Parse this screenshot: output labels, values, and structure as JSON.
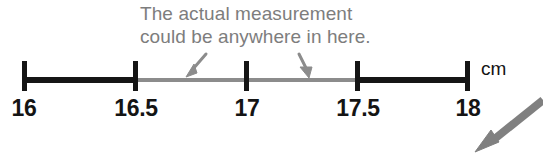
{
  "figure": {
    "type": "ruler-measurement-diagram",
    "background_color": "#ffffff",
    "caption": {
      "line1": "The actual measurement",
      "line2": "could be anywhere in here.",
      "color": "#7d7d7d"
    },
    "unit_label": "cm"
  },
  "ruler": {
    "axis_color_certain": "#151515",
    "axis_color_uncertain": "#8c8c8c",
    "ticks": [
      {
        "label": "16",
        "value": 16,
        "x": 24
      },
      {
        "label": "16.5",
        "value": 16.5,
        "x": 135
      },
      {
        "label": "17",
        "value": 17,
        "x": 246
      },
      {
        "label": "17.5",
        "value": 17.5,
        "x": 357
      },
      {
        "label": "18",
        "value": 18,
        "x": 467
      }
    ],
    "segments": [
      {
        "name": "certain-left",
        "from": 16,
        "to": 16.5,
        "style": "black"
      },
      {
        "name": "uncertain",
        "from": 16.5,
        "to": 17.5,
        "style": "gray"
      },
      {
        "name": "certain-right",
        "from": 17.5,
        "to": 18,
        "style": "black"
      }
    ]
  },
  "annotations": {
    "pointer_left": {
      "name": "caption-arrow-left",
      "color": "#8c8c8c"
    },
    "pointer_right": {
      "name": "caption-arrow-right",
      "color": "#8c8c8c"
    },
    "big_pointer": {
      "name": "external-callout-arrow",
      "color": "#808080"
    }
  }
}
